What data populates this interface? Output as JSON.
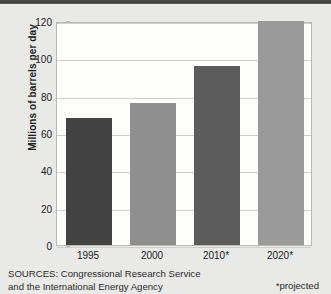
{
  "chart_data": {
    "type": "bar",
    "title": "",
    "subtitle": "",
    "xlabel": "",
    "ylabel": "Millions of barrels per day",
    "categories": [
      "1995",
      "2000",
      "2010*",
      "2020*"
    ],
    "values": [
      68,
      76,
      96,
      120
    ],
    "series": [
      {
        "name": "World oil demand",
        "values": [
          68,
          76,
          96,
          120
        ]
      }
    ],
    "ylim": [
      0,
      120
    ],
    "y_ticks": [
      0,
      20,
      40,
      60,
      80,
      100,
      120
    ],
    "y_tick_labels": [
      "0",
      "20",
      "40",
      "60",
      "80",
      "100",
      "120"
    ],
    "grid": true,
    "legend": false,
    "legend_position": "none",
    "bar_colors": [
      "#434343",
      "#8f8f8f",
      "#5c5c5c",
      "#9a9a9a"
    ],
    "annotations": [
      "SOURCES: Congressional Research Service and the International Energy Agency",
      "*projected"
    ]
  },
  "figure": {
    "plot_background": "#fdfdfc",
    "page_background": "#e9e9e7",
    "gridline_color": "#cfcfcb",
    "axis_border_color": "#b9b9b5"
  },
  "footer": {
    "sources_line_1": "SOURCES: Congressional Research Service",
    "sources_line_2": "and the International Energy Agency",
    "projected_note": "*projected"
  }
}
